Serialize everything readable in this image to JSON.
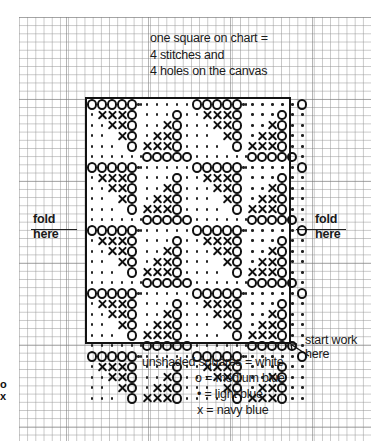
{
  "note": {
    "lines": [
      "one square on chart =",
      "4 stitches and",
      "4 holes on the canvas"
    ]
  },
  "fold_left": {
    "line1": "fold",
    "line2": "here"
  },
  "fold_right": {
    "line1": "fold",
    "line2": "here"
  },
  "start_label": {
    "line1": "start work",
    "line2": "here"
  },
  "legend": {
    "unshaded": "unshaded squares = white",
    "o": "o = medium blue",
    "dot": "• = light blue",
    "x": "x = navy blue"
  },
  "edge_glyphs": [
    "o",
    "x"
  ],
  "chart": {
    "columns": 25,
    "rows": 29,
    "symbols": {
      "o": "medium blue",
      "dot": "light blue",
      "x": "navy blue",
      "blank": "white"
    },
    "motif": [
      "ooooo.......",
      ".xxxo.....o.",
      "..xxo....xo.",
      "...xo...xxo.",
      "....o..xxxo.",
      ".......ooooo"
    ],
    "motif_dots": [
      "     .......",
      ".   .  ... .",
      "..  .  ... .",
      "..  .  ..  .",
      "... .  .   .",
      "..... .     "
    ]
  }
}
